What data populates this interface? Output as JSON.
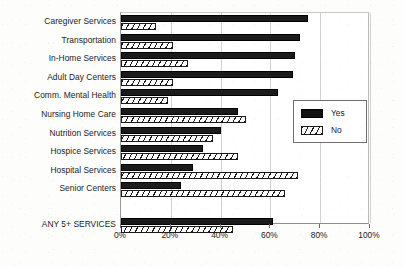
{
  "chart_data": {
    "type": "bar",
    "orientation": "horizontal",
    "title": "",
    "subtitle": "",
    "xlabel": "",
    "ylabel": "",
    "xlim": [
      0,
      100
    ],
    "xticks": [
      0,
      20,
      40,
      60,
      80,
      100
    ],
    "xtick_labels": [
      "0%",
      "20%",
      "40%",
      "60%",
      "80%",
      "100%"
    ],
    "grid": true,
    "grid_axis": "x",
    "legend_position": "center-right",
    "categories": [
      "Caregiver Services",
      "Transportation",
      "In-Home Services",
      "Adult Day Centers",
      "Comm. Mental Health",
      "Nursing Home Care",
      "Nutrition Services",
      "Hospice Services",
      "Hospital Services",
      "Senior Centers",
      "ANY 5+ SERVICES"
    ],
    "series": [
      {
        "name": "Yes",
        "color": "#111111",
        "pattern": "solid",
        "values": [
          75,
          72,
          70,
          69,
          63,
          47,
          40,
          33,
          29,
          24,
          61
        ]
      },
      {
        "name": "No",
        "color": "#ffffff",
        "pattern": "diagonal-hatch",
        "values": [
          14,
          21,
          27,
          21,
          19,
          50,
          37,
          47,
          71,
          66,
          45
        ]
      }
    ]
  },
  "legend": {
    "items": [
      {
        "label": "Yes",
        "swatch": "solid-black"
      },
      {
        "label": "No",
        "swatch": "hatched-white"
      }
    ]
  },
  "colors": {
    "yes_fill": "#111111",
    "no_fill": "#ffffff",
    "hatch_stroke": "#1a1a1a",
    "axis": "#8f8f8f",
    "gridline": "#d2d2d2",
    "text": "#232323",
    "background": "#fdfdfc"
  }
}
